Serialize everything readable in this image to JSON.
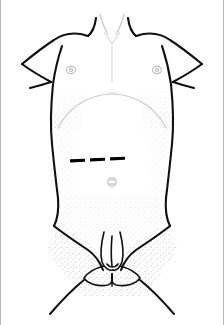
{
  "figure": {
    "title": "Anterior view of infant torso with surgical incision marking",
    "subject": "infant-male-torso",
    "view": "anterior",
    "width": 224,
    "height": 325,
    "background_color": "#ffffff",
    "frame_color": "#b8b8b8",
    "line_color": "#101010",
    "faint_line_color": "#c9c9c9",
    "stipple_color": "#8a8a8a",
    "marking_color": "#000000"
  },
  "annotations": {
    "incision_marking": {
      "label": "incision-line",
      "style": "dashed",
      "color": "#000000",
      "dash_count": 3,
      "dashes": [
        {
          "x": 70,
          "y": 159,
          "width": 15,
          "height": 3.2,
          "rotation": -3
        },
        {
          "x": 90,
          "y": 158,
          "width": 15,
          "height": 3.2,
          "rotation": -3
        },
        {
          "x": 110,
          "y": 157,
          "width": 15,
          "height": 3.2,
          "rotation": -3
        }
      ]
    },
    "landmarks": [
      {
        "name": "left-nipple",
        "cx": 71,
        "cy": 70,
        "rx": 4.5,
        "ry": 3.6
      },
      {
        "name": "right-nipple",
        "cx": 157,
        "cy": 70,
        "rx": 4.5,
        "ry": 3.6
      },
      {
        "name": "umbilicus",
        "cx": 112,
        "cy": 182,
        "rx": 4.2,
        "ry": 4.2
      },
      {
        "name": "suprasternal-notch",
        "cx": 112,
        "cy": 30,
        "rx": 0,
        "ry": 0
      },
      {
        "name": "costal-margin",
        "cx": 112,
        "cy": 100,
        "rx": 0,
        "ry": 0
      }
    ]
  },
  "body_parts": [
    {
      "name": "neck",
      "region": "superior-midline"
    },
    {
      "name": "left-clavicle",
      "region": "superior-left"
    },
    {
      "name": "right-clavicle",
      "region": "superior-right"
    },
    {
      "name": "left-shoulder",
      "region": "lateral-left"
    },
    {
      "name": "right-shoulder",
      "region": "lateral-right"
    },
    {
      "name": "left-arm",
      "region": "lateral-left"
    },
    {
      "name": "right-arm",
      "region": "lateral-right"
    },
    {
      "name": "chest",
      "region": "central-superior"
    },
    {
      "name": "abdomen",
      "region": "central"
    },
    {
      "name": "left-flank",
      "region": "lateral-left"
    },
    {
      "name": "right-flank",
      "region": "lateral-right"
    },
    {
      "name": "pelvis",
      "region": "central-inferior"
    },
    {
      "name": "genitalia",
      "region": "inferior-midline"
    },
    {
      "name": "left-thigh",
      "region": "inferior-left"
    },
    {
      "name": "right-thigh",
      "region": "inferior-right"
    }
  ]
}
